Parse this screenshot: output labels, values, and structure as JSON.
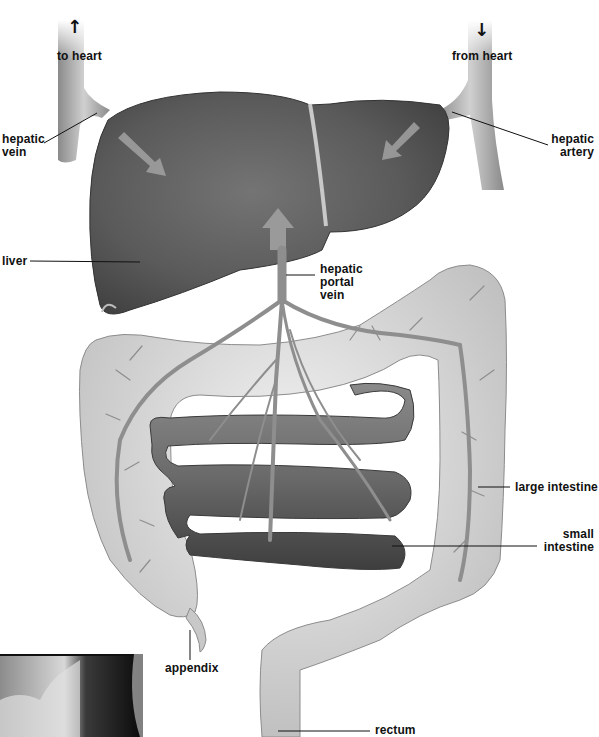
{
  "diagram": {
    "title_hidden": "Hepatic portal circulation",
    "labels": {
      "to_heart": "to heart",
      "from_heart": "from heart",
      "hepatic_vein": "hepatic\nvein",
      "hepatic_vein_l1": "hepatic",
      "hepatic_vein_l2": "vein",
      "hepatic_artery_l1": "hepatic",
      "hepatic_artery_l2": "artery",
      "liver": "liver",
      "hepatic_portal_vein_l1": "hepatic",
      "hepatic_portal_vein_l2": "portal",
      "hepatic_portal_vein_l3": "vein",
      "large_intestine": "large intestine",
      "small_intestine_l1": "small",
      "small_intestine_l2": "intestine",
      "appendix": "appendix",
      "rectum": "rectum"
    },
    "arrows": {
      "up": "↑",
      "down": "↓"
    },
    "colors": {
      "liver": "#5e5e5e",
      "liver_dark": "#3e3e3e",
      "vessel": "#9a9a9a",
      "large_intestine": "#d6d6d6",
      "small_intestine": "#6c6c6c",
      "flow_arrow": "#b4b4b4",
      "text": "#111111"
    },
    "inset_photo": "micrograph-inset"
  }
}
